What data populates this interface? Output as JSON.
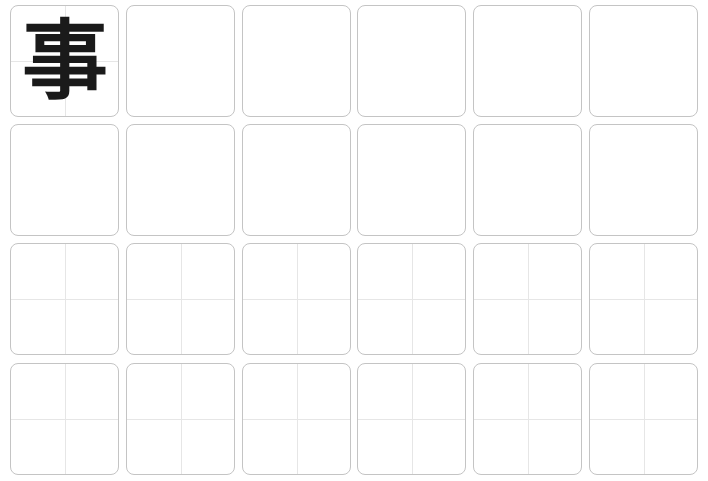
{
  "worksheet": {
    "character": "事",
    "columns": 6,
    "rows": 4,
    "cell_width": 109,
    "cell_height": 112,
    "col_x": [
      10,
      126,
      242,
      357,
      473,
      589
    ],
    "row_y": [
      5,
      124,
      243,
      363
    ],
    "rows_with_guides": [
      0,
      2,
      3
    ],
    "guide_cells_row0": [
      0
    ],
    "colors": {
      "border": "#c4c4c4",
      "guide": "#e6e6e6",
      "ink": "#1a1a1a"
    }
  }
}
